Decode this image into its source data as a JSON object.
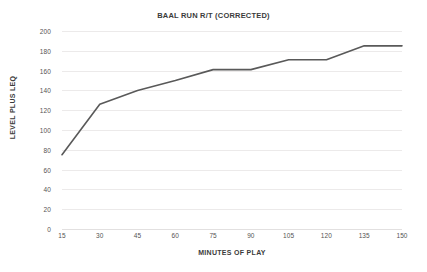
{
  "chart_data": {
    "type": "line",
    "title": "BAAL RUN R/T (CORRECTED)",
    "xlabel": "MINUTES OF PLAY",
    "ylabel": "LEVEL PLUS LEQ",
    "x": [
      15,
      30,
      45,
      60,
      75,
      90,
      105,
      120,
      135,
      150
    ],
    "xticklabels": [
      "15",
      "30",
      "45",
      "60",
      "75",
      "90",
      "105",
      "120",
      "135",
      "150"
    ],
    "values": [
      75,
      126,
      140,
      150,
      161,
      161,
      171,
      171,
      185,
      185
    ],
    "yticks": [
      0,
      20,
      40,
      60,
      80,
      100,
      120,
      140,
      160,
      180,
      200
    ],
    "yticklabels": [
      "0",
      "20",
      "40",
      "60",
      "80",
      "100",
      "120",
      "140",
      "160",
      "180",
      "200"
    ],
    "ylim": [
      0,
      200
    ],
    "xlim": [
      15,
      150
    ],
    "grid": "horizontal",
    "legend": "none",
    "series": [
      {
        "name": "BAAL RUN R/T (CORRECTED)",
        "values": [
          75,
          126,
          140,
          150,
          161,
          161,
          171,
          171,
          185,
          185
        ],
        "color": "#595959",
        "line_width": 1.6,
        "markers": "none"
      }
    ],
    "colors": {
      "line": "#595959",
      "grid": "#eceaea",
      "text": "#3b3b3b",
      "tick_text": "#555353",
      "background": "#ffffff"
    }
  }
}
